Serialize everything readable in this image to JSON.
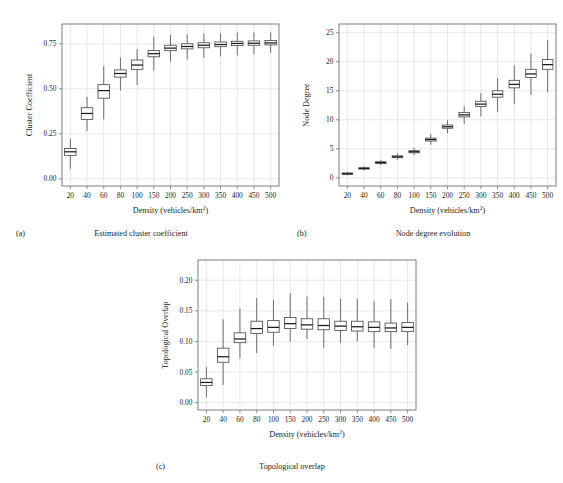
{
  "figure": {
    "background": "#ffffff",
    "ink": "#231f20",
    "grid_color": "#d9d9d9",
    "frame_color": "#6f6f6f",
    "box_color": "#4d4d4d"
  },
  "panels": [
    {
      "letter": "(a)",
      "caption": "Estimated cluster coefficient",
      "chart_data": {
        "type": "box",
        "title": "Estimated cluster coefficient",
        "xlabel": "Density (vehicles/km2)",
        "xlabel_base": "Density (vehicles/km",
        "xlabel_sup": "2",
        "xlabel_tail": ")",
        "ylabel": "Cluster Coefficient",
        "categories": [
          "20",
          "40",
          "60",
          "80",
          "100",
          "150",
          "200",
          "250",
          "300",
          "350",
          "400",
          "450",
          "500"
        ],
        "ytick_values": [
          0.0,
          0.25,
          0.5,
          0.75
        ],
        "ytick_labels": [
          "0.00",
          "0.25",
          "0.50",
          "0.75"
        ],
        "ylim": [
          -0.04,
          0.86
        ],
        "grid": true,
        "boxes": [
          {
            "category": "20",
            "whisker_low": 0.055,
            "q1": 0.13,
            "median": 0.15,
            "q3": 0.168,
            "whisker_high": 0.222
          },
          {
            "category": "40",
            "whisker_low": 0.265,
            "q1": 0.33,
            "median": 0.363,
            "q3": 0.395,
            "whisker_high": 0.455
          },
          {
            "category": "60",
            "whisker_low": 0.33,
            "q1": 0.448,
            "median": 0.49,
            "q3": 0.523,
            "whisker_high": 0.628
          },
          {
            "category": "80",
            "whisker_low": 0.49,
            "q1": 0.565,
            "median": 0.585,
            "q3": 0.605,
            "whisker_high": 0.675
          },
          {
            "category": "100",
            "whisker_low": 0.52,
            "q1": 0.608,
            "median": 0.632,
            "q3": 0.66,
            "whisker_high": 0.72
          },
          {
            "category": "150",
            "whisker_low": 0.6,
            "q1": 0.678,
            "median": 0.695,
            "q3": 0.712,
            "whisker_high": 0.79
          },
          {
            "category": "200",
            "whisker_low": 0.65,
            "q1": 0.712,
            "median": 0.726,
            "q3": 0.742,
            "whisker_high": 0.8
          },
          {
            "category": "250",
            "whisker_low": 0.663,
            "q1": 0.722,
            "median": 0.735,
            "q3": 0.75,
            "whisker_high": 0.802
          },
          {
            "category": "300",
            "whisker_low": 0.672,
            "q1": 0.728,
            "median": 0.742,
            "q3": 0.756,
            "whisker_high": 0.808
          },
          {
            "category": "350",
            "whisker_low": 0.68,
            "q1": 0.734,
            "median": 0.746,
            "q3": 0.76,
            "whisker_high": 0.808
          },
          {
            "category": "400",
            "whisker_low": 0.686,
            "q1": 0.74,
            "median": 0.752,
            "q3": 0.764,
            "whisker_high": 0.812
          },
          {
            "category": "450",
            "whisker_low": 0.692,
            "q1": 0.742,
            "median": 0.753,
            "q3": 0.766,
            "whisker_high": 0.812
          },
          {
            "category": "500",
            "whisker_low": 0.7,
            "q1": 0.744,
            "median": 0.755,
            "q3": 0.768,
            "whisker_high": 0.812
          }
        ]
      }
    },
    {
      "letter": "(b)",
      "caption": "Node degree evolution",
      "chart_data": {
        "type": "box",
        "title": "Node degree evolution",
        "xlabel": "Density (vehicles/km2)",
        "xlabel_base": "Density (vehicles/km",
        "xlabel_sup": "2",
        "xlabel_tail": ")",
        "ylabel": "Node Degree",
        "categories": [
          "20",
          "40",
          "60",
          "80",
          "100",
          "150",
          "200",
          "250",
          "300",
          "350",
          "400",
          "450",
          "500"
        ],
        "ytick_values": [
          0,
          5,
          10,
          15,
          20,
          25
        ],
        "ytick_labels": [
          "0",
          "5",
          "10",
          "15",
          "20",
          "25"
        ],
        "ylim": [
          -1.4,
          26.5
        ],
        "grid": true,
        "boxes": [
          {
            "category": "20",
            "whisker_low": 0.4,
            "q1": 0.62,
            "median": 0.72,
            "q3": 0.85,
            "whisker_high": 1.05
          },
          {
            "category": "40",
            "whisker_low": 1.25,
            "q1": 1.52,
            "median": 1.62,
            "q3": 1.75,
            "whisker_high": 2.0
          },
          {
            "category": "60",
            "whisker_low": 2.2,
            "q1": 2.5,
            "median": 2.62,
            "q3": 2.78,
            "whisker_high": 3.1
          },
          {
            "category": "80",
            "whisker_low": 3.1,
            "q1": 3.48,
            "median": 3.62,
            "q3": 3.8,
            "whisker_high": 4.2
          },
          {
            "category": "100",
            "whisker_low": 3.9,
            "q1": 4.32,
            "median": 4.5,
            "q3": 4.68,
            "whisker_high": 5.15
          },
          {
            "category": "150",
            "whisker_low": 5.7,
            "q1": 6.35,
            "median": 6.6,
            "q3": 6.85,
            "whisker_high": 7.5
          },
          {
            "category": "200",
            "whisker_low": 7.7,
            "q1": 8.55,
            "median": 8.8,
            "q3": 9.1,
            "whisker_high": 9.9
          },
          {
            "category": "250",
            "whisker_low": 9.3,
            "q1": 10.5,
            "median": 10.85,
            "q3": 11.25,
            "whisker_high": 12.3
          },
          {
            "category": "300",
            "whisker_low": 10.6,
            "q1": 12.3,
            "median": 12.7,
            "q3": 13.2,
            "whisker_high": 14.6
          },
          {
            "category": "350",
            "whisker_low": 11.4,
            "q1": 13.9,
            "median": 14.4,
            "q3": 15.0,
            "whisker_high": 17.2
          },
          {
            "category": "400",
            "whisker_low": 12.7,
            "q1": 15.5,
            "median": 16.1,
            "q3": 16.8,
            "whisker_high": 19.4
          },
          {
            "category": "450",
            "whisker_low": 14.3,
            "q1": 17.3,
            "median": 17.9,
            "q3": 18.7,
            "whisker_high": 21.4
          },
          {
            "category": "500",
            "whisker_low": 14.8,
            "q1": 18.7,
            "median": 19.5,
            "q3": 20.4,
            "whisker_high": 23.7
          }
        ]
      }
    },
    {
      "letter": "(c)",
      "caption": "Topological overlap",
      "chart_data": {
        "type": "box",
        "title": "Topological overlap",
        "xlabel": "Density (vehicles/km2)",
        "xlabel_base": "Density (vehicles/km",
        "xlabel_sup": "2",
        "xlabel_tail": ")",
        "ylabel": "Topological Overlap",
        "categories": [
          "20",
          "40",
          "60",
          "80",
          "100",
          "150",
          "200",
          "250",
          "300",
          "350",
          "400",
          "450",
          "500"
        ],
        "ytick_values": [
          0.0,
          0.05,
          0.1,
          0.15,
          0.2
        ],
        "ytick_labels": [
          "0.00",
          "0.05",
          "0.10",
          "0.15",
          "0.20"
        ],
        "ylim": [
          -0.012,
          0.233
        ],
        "grid": true,
        "boxes": [
          {
            "category": "20",
            "whisker_low": 0.009,
            "q1": 0.028,
            "median": 0.033,
            "q3": 0.039,
            "whisker_high": 0.058
          },
          {
            "category": "40",
            "whisker_low": 0.029,
            "q1": 0.066,
            "median": 0.075,
            "q3": 0.089,
            "whisker_high": 0.136
          },
          {
            "category": "60",
            "whisker_low": 0.072,
            "q1": 0.098,
            "median": 0.104,
            "q3": 0.114,
            "whisker_high": 0.154
          },
          {
            "category": "80",
            "whisker_low": 0.081,
            "q1": 0.113,
            "median": 0.121,
            "q3": 0.133,
            "whisker_high": 0.171
          },
          {
            "category": "100",
            "whisker_low": 0.093,
            "q1": 0.115,
            "median": 0.123,
            "q3": 0.134,
            "whisker_high": 0.168
          },
          {
            "category": "150",
            "whisker_low": 0.1,
            "q1": 0.121,
            "median": 0.129,
            "q3": 0.139,
            "whisker_high": 0.179
          },
          {
            "category": "200",
            "whisker_low": 0.104,
            "q1": 0.12,
            "median": 0.127,
            "q3": 0.137,
            "whisker_high": 0.173
          },
          {
            "category": "250",
            "whisker_low": 0.09,
            "q1": 0.119,
            "median": 0.126,
            "q3": 0.137,
            "whisker_high": 0.173
          },
          {
            "category": "300",
            "whisker_low": 0.098,
            "q1": 0.118,
            "median": 0.125,
            "q3": 0.133,
            "whisker_high": 0.17
          },
          {
            "category": "350",
            "whisker_low": 0.1,
            "q1": 0.117,
            "median": 0.124,
            "q3": 0.133,
            "whisker_high": 0.17
          },
          {
            "category": "400",
            "whisker_low": 0.089,
            "q1": 0.116,
            "median": 0.123,
            "q3": 0.132,
            "whisker_high": 0.166
          },
          {
            "category": "450",
            "whisker_low": 0.088,
            "q1": 0.116,
            "median": 0.122,
            "q3": 0.13,
            "whisker_high": 0.169
          },
          {
            "category": "500",
            "whisker_low": 0.094,
            "q1": 0.116,
            "median": 0.123,
            "q3": 0.131,
            "whisker_high": 0.163
          }
        ]
      }
    }
  ]
}
